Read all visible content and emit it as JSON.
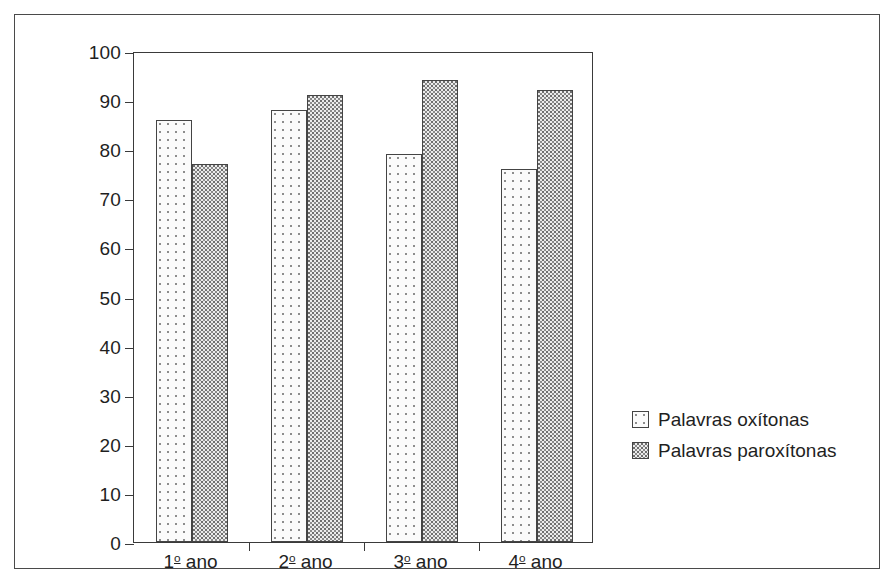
{
  "chart_data": {
    "type": "bar",
    "title": "",
    "subtitle": "",
    "xlabel": "",
    "ylabel": "",
    "ylim": [
      0,
      100
    ],
    "ytick_step": 10,
    "yticks": [
      "100",
      "90",
      "80",
      "70",
      "60",
      "50",
      "40",
      "30",
      "20",
      "10",
      "0"
    ],
    "grid": false,
    "legend_position": "right",
    "categories": [
      "1º ano",
      "2º ano",
      "3º ano",
      "4º ano"
    ],
    "category_prefixes": [
      "1",
      "2",
      "3",
      "4"
    ],
    "category_ordinal": "o",
    "category_suffix": " ano",
    "series": [
      {
        "name": "Palavras oxítonas",
        "pattern": "light-sparse-dots",
        "values": [
          86,
          88,
          79,
          76
        ]
      },
      {
        "name": "Palavras paroxítonas",
        "pattern": "dense-dark-dots",
        "values": [
          77,
          91,
          94,
          92
        ]
      }
    ]
  },
  "colors": {
    "frame": "#4a4a4a",
    "axis": "#3a3a3a",
    "bar_outline": "#444444",
    "series1_fill": "#fbfbfb",
    "series1_dot": "#8d8d8d",
    "series2_fill": "#ebebeb",
    "series2_dot": "#6e6e6e",
    "text": "#1f1f1f",
    "background": "#ffffff"
  }
}
